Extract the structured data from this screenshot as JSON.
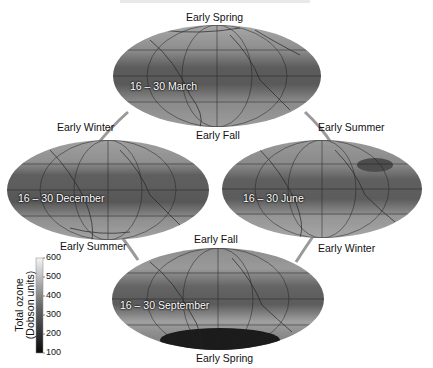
{
  "figure": {
    "title_clipped": "",
    "season_labels": {
      "top_above": "Early Spring",
      "top_below": "Early Fall",
      "left_above": "Early Winter",
      "left_below": "Early Summer",
      "right_above": "Early Summer",
      "right_below": "Early Winter",
      "bottom_above": "Early Fall",
      "bottom_below": "Early Spring"
    },
    "maps": [
      {
        "id": "march",
        "label": "16 – 30 March",
        "position": "top"
      },
      {
        "id": "december",
        "label": "16 – 30 December",
        "position": "left"
      },
      {
        "id": "june",
        "label": "16 – 30 June",
        "position": "right"
      },
      {
        "id": "september",
        "label": "16 – 30 September",
        "position": "bottom"
      }
    ],
    "colorbar": {
      "label_line1": "Total ozone",
      "label_line2": "(Dobson units)",
      "ticks": [
        "600",
        "500",
        "400",
        "300",
        "200",
        "100"
      ],
      "min": 100,
      "max": 600,
      "color_low": "#0a0a0a",
      "color_high": "#f5f5f5"
    },
    "colors": {
      "connector": "#9a9a9a",
      "map_base": "#7a7a7a",
      "equator_band": "#5e5e5e",
      "grid": "#222222"
    }
  }
}
